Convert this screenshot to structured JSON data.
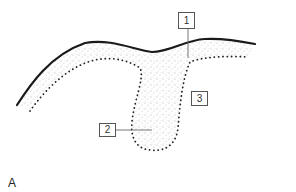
{
  "figure": {
    "panel_letter": "A",
    "labels": [
      {
        "id": "1",
        "text": "1"
      },
      {
        "id": "2",
        "text": "2"
      },
      {
        "id": "3",
        "text": "3"
      }
    ],
    "colors": {
      "outline": "#1a1a1a",
      "stipple": "#555555",
      "label_border": "#555555",
      "leader_line": "#666666"
    }
  }
}
